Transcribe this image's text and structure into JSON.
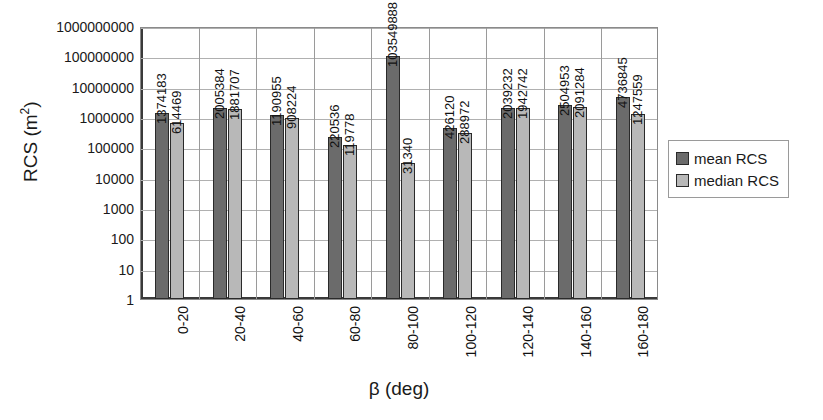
{
  "chart_data": {
    "type": "bar",
    "title": "",
    "xlabel": "β (deg)",
    "ylabel": "RCS (m²)",
    "yscale": "log",
    "ylim": [
      1,
      1000000000
    ],
    "ytick_labels": [
      "1000000000",
      "100000000",
      "10000000",
      "1000000",
      "100000",
      "10000",
      "1000",
      "100",
      "10",
      "1"
    ],
    "ytick_values": [
      1000000000,
      100000000,
      10000000,
      1000000,
      100000,
      10000,
      1000,
      100,
      10,
      1
    ],
    "grid": true,
    "legend_position": "right",
    "categories": [
      "0-20",
      "20-40",
      "40-60",
      "60-80",
      "80-100",
      "100-120",
      "120-140",
      "140-160",
      "160-180"
    ],
    "series": [
      {
        "name": "mean RCS",
        "color": "#6b6b6b",
        "values": [
          1374183,
          2005384,
          1190955,
          220536,
          103549888,
          426120,
          2039232,
          2504953,
          4736845
        ],
        "labels": [
          "1374183",
          "2005384",
          "1190955",
          "220536",
          "103549888",
          "426120",
          "2039232",
          "2504953",
          "4736845"
        ]
      },
      {
        "name": "median RCS",
        "color": "#b8b8b8",
        "values": [
          614469,
          1881707,
          908224,
          119778,
          31340,
          288972,
          1942742,
          2091284,
          1247559
        ],
        "labels": [
          "614469",
          "1881707",
          "908224",
          "119778",
          "31340",
          "288972",
          "1942742",
          "2091284",
          "1247559"
        ]
      }
    ]
  },
  "legend": {
    "items": [
      {
        "label": "mean RCS",
        "color": "#6b6b6b"
      },
      {
        "label": "median RCS",
        "color": "#b8b8b8"
      }
    ]
  },
  "axes": {
    "y_title_main": "RCS (m",
    "y_title_sup": "2",
    "y_title_tail": ")",
    "x_title": "β (deg)"
  }
}
